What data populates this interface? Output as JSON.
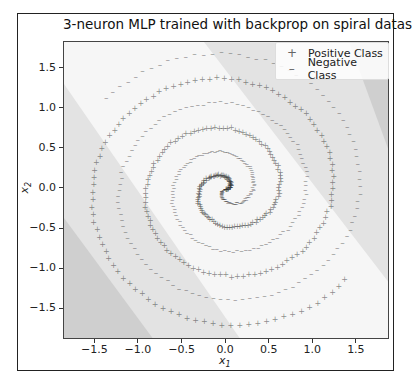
{
  "chart_data": {
    "type": "scatter",
    "title": "3-neuron MLP trained with backprop on spiral dataset",
    "xlabel": "x1",
    "ylabel": "x2",
    "xlim": [
      -1.86,
      1.88
    ],
    "ylim": [
      -1.88,
      1.83
    ],
    "xticks": [
      -1.5,
      -1.0,
      -0.5,
      0.0,
      0.5,
      1.0,
      1.5
    ],
    "yticks": [
      -1.5,
      -1.0,
      -0.5,
      0.0,
      0.5,
      1.0,
      1.5
    ],
    "xtick_labels": [
      "−1.5",
      "−1.0",
      "−0.5",
      "0.0",
      "0.5",
      "1.0",
      "1.5"
    ],
    "ytick_labels": [
      "−1.5",
      "−1.0",
      "−0.5",
      "0.0",
      "0.5",
      "1.0",
      "1.5"
    ],
    "legend": {
      "position": "upper right",
      "entries": [
        {
          "label": "Positive Class",
          "marker": "+"
        },
        {
          "label": "Negative Class",
          "marker": "–"
        }
      ]
    },
    "series": [
      {
        "name": "Positive Class",
        "marker": "+",
        "description": "Archimedean spiral arm, ~3 turns, radius 0 to ~1.8",
        "phase": 0
      },
      {
        "name": "Negative Class",
        "marker": "-",
        "description": "Archimedean spiral arm rotated 180 deg, ~3 turns, radius 0 to ~1.8",
        "phase": 3.14159
      }
    ],
    "spiral": {
      "turns": 2.9,
      "max_radius": 1.78,
      "points_per_class": 300
    },
    "decision_regions": {
      "colors": [
        "#cfcfcf",
        "#e3e3e3",
        "#f6f6f6",
        "#e3e3e3",
        "#cfcfcf"
      ],
      "description": "Five diagonal bands of graded gray; lightest band through center, darker toward top-right and bottom-left corners"
    },
    "grid": false
  },
  "colors": {
    "point": "#333333",
    "band_light": "#f6f6f6",
    "band_mid": "#e3e3e3",
    "band_dark": "#cfcfcf"
  }
}
